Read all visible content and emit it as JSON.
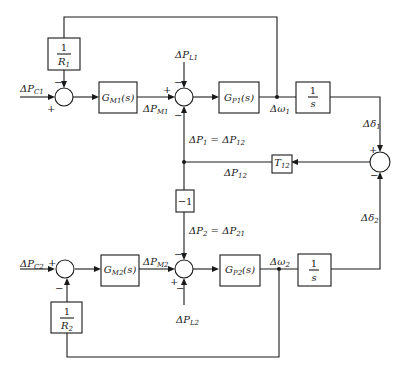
{
  "diagram": {
    "title": "",
    "blocks": {
      "inv_R1": {
        "num": "1",
        "den": "R",
        "den_sub": "1"
      },
      "GM1": {
        "main": "G",
        "sub": "M1",
        "arg": "(s)"
      },
      "GP1": {
        "main": "G",
        "sub": "P1",
        "arg": "(s)"
      },
      "int1": {
        "num": "1",
        "den": "s"
      },
      "T12": {
        "main": "T",
        "sub": "12"
      },
      "neg1": {
        "text": "−1"
      },
      "GM2": {
        "main": "G",
        "sub": "M2",
        "arg": "(s)"
      },
      "GP2": {
        "main": "G",
        "sub": "P2",
        "arg": "(s)"
      },
      "int2": {
        "num": "1",
        "den": "s"
      },
      "inv_R2": {
        "num": "1",
        "den": "R",
        "den_sub": "2"
      }
    },
    "signals": {
      "PC1": {
        "main": "ΔP",
        "sub": "C1"
      },
      "PM1": {
        "main": "ΔP",
        "sub": "M1"
      },
      "PL1": {
        "main": "ΔP",
        "sub": "L1"
      },
      "w1": {
        "main": "Δω",
        "sub": "1"
      },
      "d1": {
        "main": "Δδ",
        "sub": "1"
      },
      "P1eq": {
        "a": "ΔP",
        "a_sub": "1",
        "eq": " = ",
        "b": "ΔP",
        "b_sub": "12"
      },
      "P12": {
        "main": "ΔP",
        "sub": "12"
      },
      "P2eq": {
        "a": "ΔP",
        "a_sub": "2",
        "eq": " = ",
        "b": "ΔP",
        "b_sub": "21"
      },
      "d2": {
        "main": "Δδ",
        "sub": "2"
      },
      "PC2": {
        "main": "ΔP",
        "sub": "C2"
      },
      "PM2": {
        "main": "ΔP",
        "sub": "M2"
      },
      "PL2": {
        "main": "ΔP",
        "sub": "L2"
      },
      "w2": {
        "main": "Δω",
        "sub": "2"
      }
    },
    "signs": {
      "plus": "+",
      "minus": "−"
    }
  }
}
